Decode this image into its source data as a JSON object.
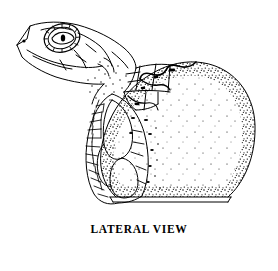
{
  "figure": {
    "caption": "LATERAL VIEW",
    "style": "black-and-white-line-drawing-with-stipple",
    "colors": {
      "ink": "#000000",
      "background": "#ffffff"
    }
  },
  "parts": {
    "head": "head",
    "snout": "snout",
    "nostril": "nostril",
    "eye": "eye",
    "pupil": "pupil",
    "eye_scale_ring": "eye-scale-ring",
    "neck": "neck",
    "head_scutes": "head-scutes",
    "carapace_plates": "carapace-plates",
    "flipper": "front-flipper",
    "body_scales": "body-scales",
    "egg_shell": "egg-shell",
    "egg_stipple": "egg-shell-stipple-texture",
    "shell_break": "shell-break-edge",
    "ground_line": "ground-line"
  }
}
